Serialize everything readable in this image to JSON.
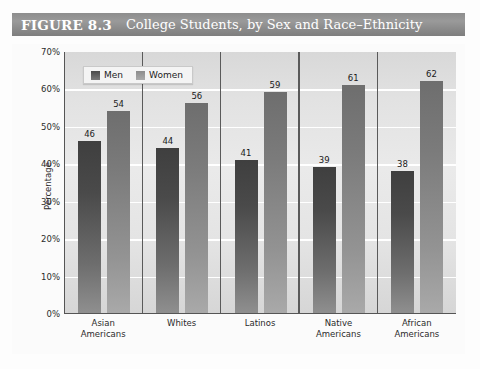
{
  "figure": {
    "number": "FIGURE 8.3",
    "title": "College Students, by Sex and Race–Ethnicity"
  },
  "legend": {
    "items": [
      {
        "label": "Men",
        "key": "men",
        "color": "#4a4a4a"
      },
      {
        "label": "Women",
        "key": "women",
        "color": "#9a9a9a"
      }
    ]
  },
  "axis": {
    "y_title": "Percentage",
    "y_ticks": [
      "70%",
      "60%",
      "50%",
      "40%",
      "30%",
      "20%",
      "10%",
      "0%"
    ]
  },
  "chart_data": {
    "type": "bar",
    "title": "College Students, by Sex and Race–Ethnicity",
    "xlabel": "",
    "ylabel": "Percentage",
    "ylim": [
      0,
      70
    ],
    "ytick_step": 10,
    "grid": true,
    "legend_position": "top-left inside plot",
    "categories": [
      "Asian Americans",
      "Whites",
      "Latinos",
      "Native Americans",
      "African Americans"
    ],
    "category_lines": [
      [
        "Asian",
        "Americans"
      ],
      [
        "Whites",
        ""
      ],
      [
        "Latinos",
        ""
      ],
      [
        "Native",
        "Americans"
      ],
      [
        "African",
        "Americans"
      ]
    ],
    "series": [
      {
        "name": "Men",
        "values": [
          46,
          44,
          41,
          39,
          38
        ]
      },
      {
        "name": "Women",
        "values": [
          54,
          56,
          59,
          61,
          62
        ]
      }
    ]
  }
}
